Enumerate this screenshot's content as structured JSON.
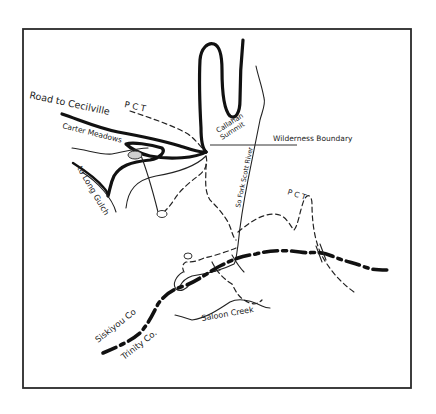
{
  "map": {
    "title": "Carter Meadows / Callahan Summit area sketch map",
    "labels": {
      "road_to_cecilville": "Road to Cecilville",
      "pct_north": "P C T",
      "carter_meadows": "Carter Meadows",
      "to_long_gulch": "to Long Gulch",
      "callahan_line1": "Callahan",
      "callahan_line2": "Summit",
      "wilderness_boundary": "Wilderness Boundary",
      "so_fork_scott_river": "So Fork Scott River",
      "pct_east": "P C T",
      "siskiyou_co": "Siskiyou Co",
      "trinity_co": "Trinity Co.",
      "saloon_creek": "Saloon Creek"
    },
    "legend_features": [
      "road",
      "stream",
      "trail (PCT)",
      "county line",
      "wilderness boundary",
      "lake"
    ],
    "colors": {
      "ink": "#111111",
      "lake_fill": "#cfcfcf",
      "background": "#ffffff"
    }
  }
}
